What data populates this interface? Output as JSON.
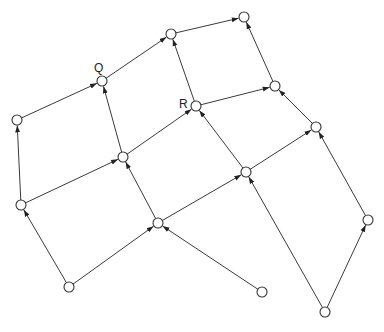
{
  "diagram": {
    "type": "directed-graph",
    "node_radius": 5,
    "colors": {
      "edge": "#3a3a3a",
      "node_stroke": "#333333",
      "node_fill": "#ffffff"
    },
    "nodes": [
      {
        "id": "n1",
        "x": 69,
        "y": 287,
        "label": ""
      },
      {
        "id": "n2",
        "x": 21,
        "y": 205,
        "label": ""
      },
      {
        "id": "n3",
        "x": 17,
        "y": 120,
        "label": ""
      },
      {
        "id": "Q",
        "x": 102,
        "y": 81,
        "label": "Q"
      },
      {
        "id": "n5",
        "x": 123,
        "y": 157,
        "label": ""
      },
      {
        "id": "n6",
        "x": 158,
        "y": 223,
        "label": ""
      },
      {
        "id": "n7",
        "x": 262,
        "y": 292,
        "label": ""
      },
      {
        "id": "n8",
        "x": 171,
        "y": 34,
        "label": ""
      },
      {
        "id": "R",
        "x": 196,
        "y": 106,
        "label": "R"
      },
      {
        "id": "n10",
        "x": 244,
        "y": 17,
        "label": ""
      },
      {
        "id": "n11",
        "x": 275,
        "y": 86,
        "label": ""
      },
      {
        "id": "n12",
        "x": 246,
        "y": 172,
        "label": ""
      },
      {
        "id": "n13",
        "x": 316,
        "y": 127,
        "label": ""
      },
      {
        "id": "n14",
        "x": 368,
        "y": 220,
        "label": ""
      },
      {
        "id": "n15",
        "x": 325,
        "y": 312,
        "label": ""
      }
    ],
    "edges": [
      [
        "n1",
        "n2"
      ],
      [
        "n1",
        "n6"
      ],
      [
        "n2",
        "n3"
      ],
      [
        "n2",
        "n5"
      ],
      [
        "n3",
        "Q"
      ],
      [
        "n7",
        "n6"
      ],
      [
        "n6",
        "n5"
      ],
      [
        "n6",
        "n12"
      ],
      [
        "n5",
        "Q"
      ],
      [
        "n5",
        "R"
      ],
      [
        "Q",
        "n8"
      ],
      [
        "R",
        "n8"
      ],
      [
        "R",
        "n11"
      ],
      [
        "n8",
        "n10"
      ],
      [
        "n15",
        "n12"
      ],
      [
        "n15",
        "n14"
      ],
      [
        "n12",
        "R"
      ],
      [
        "n12",
        "n13"
      ],
      [
        "n14",
        "n13"
      ],
      [
        "n13",
        "n11"
      ],
      [
        "n11",
        "n10"
      ]
    ],
    "labels": {
      "q": {
        "text": "Q",
        "x": 94,
        "y": 62
      },
      "r": {
        "text": "R",
        "x": 179,
        "y": 98
      }
    }
  }
}
